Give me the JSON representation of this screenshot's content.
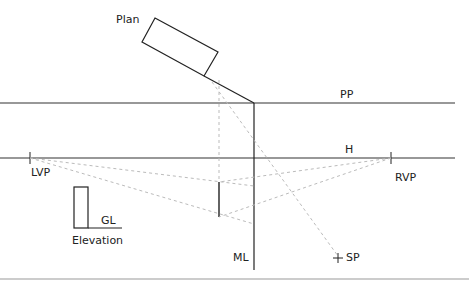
{
  "labels": {
    "plan": "Plan",
    "pp": "PP",
    "h": "H",
    "lvp": "LVP",
    "rvp": "RVP",
    "gl": "GL",
    "elevation": "Elevation",
    "ml": "ML",
    "sp": "SP"
  },
  "colors": {
    "line": "#222222",
    "dashed": "#bbbbbb",
    "bottom_rule": "#999999"
  }
}
